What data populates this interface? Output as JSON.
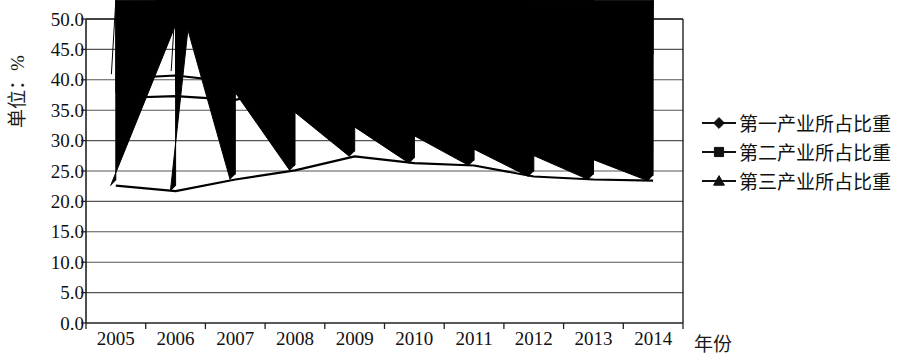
{
  "chart_data": {
    "type": "line",
    "title": "",
    "xlabel": "年份",
    "ylabel": "单位：%",
    "categories": [
      "2005",
      "2006",
      "2007",
      "2008",
      "2009",
      "2010",
      "2011",
      "2012",
      "2013",
      "2014"
    ],
    "ylim": [
      0,
      50
    ],
    "ytick_labels": [
      "0.0",
      "5.0",
      "10.0",
      "15.0",
      "20.0",
      "25.0",
      "30.0",
      "35.0",
      "40.0",
      "45.0",
      "50.0"
    ],
    "ytick_values": [
      0,
      5,
      10,
      15,
      20,
      25,
      30,
      35,
      40,
      45,
      50
    ],
    "grid": true,
    "legend_position": "right",
    "series": [
      {
        "name": "第一产业所占比重",
        "marker": "diamond",
        "color": "#000000",
        "values": [
          37.0,
          37.3,
          36.7,
          38.8,
          37.4,
          37.9,
          39.5,
          42.8,
          43.5,
          43.3
        ]
      },
      {
        "name": "第二产业所占比重",
        "marker": "square",
        "color": "#000000",
        "values": [
          40.2,
          40.7,
          39.6,
          36.1,
          34.9,
          35.6,
          34.2,
          33.1,
          32.8,
          33.4
        ]
      },
      {
        "name": "第三产业所占比重",
        "marker": "triangle",
        "color": "#000000",
        "values": [
          22.6,
          21.7,
          23.6,
          25.1,
          27.4,
          26.3,
          25.9,
          24.1,
          23.6,
          23.4
        ]
      }
    ]
  },
  "axes": {
    "y_axis_label": "单位：%",
    "x_axis_label": "年份"
  },
  "legend": {
    "items": [
      {
        "label": "第一产业所占比重",
        "marker": "diamond"
      },
      {
        "label": "第二产业所占比重",
        "marker": "square"
      },
      {
        "label": "第三产业所占比重",
        "marker": "triangle"
      }
    ]
  },
  "colors": {
    "line": "#111111",
    "grid": "#555555",
    "axis": "#222222",
    "background": "#ffffff"
  }
}
